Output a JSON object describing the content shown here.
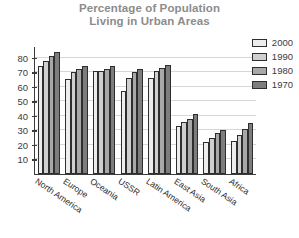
{
  "chart_data": {
    "type": "bar",
    "title": "Percentage of Population Living in Urban Areas",
    "title_line1": "Percentage of Population",
    "title_line2": "Living in Urban Areas",
    "xlabel": "",
    "ylabel": "",
    "ylim": [
      0,
      88
    ],
    "yticks": [
      10,
      20,
      30,
      40,
      50,
      60,
      70,
      80
    ],
    "grid": true,
    "legend_position": "top-right",
    "categories": [
      "North America",
      "Europe",
      "Oceania",
      "USSR",
      "Latin America",
      "East Asia",
      "South Asia",
      "Africa"
    ],
    "series": [
      {
        "name": "2000",
        "color": "#ededed",
        "values": [
          74,
          65,
          71,
          57,
          66,
          33,
          22,
          23
        ]
      },
      {
        "name": "1990",
        "color": "#cfcfcf",
        "values": [
          78,
          70,
          71,
          66,
          71,
          36,
          25,
          27
        ]
      },
      {
        "name": "1980",
        "color": "#a8a8a8",
        "values": [
          81,
          72,
          72,
          70,
          73,
          38,
          28,
          31
        ]
      },
      {
        "name": "1970",
        "color": "#7d7d7d",
        "values": [
          84,
          74,
          74,
          72,
          75,
          41,
          30,
          35
        ]
      }
    ]
  },
  "legend": {
    "items": [
      {
        "label": "2000"
      },
      {
        "label": "1990"
      },
      {
        "label": "1980"
      },
      {
        "label": "1970"
      }
    ]
  }
}
